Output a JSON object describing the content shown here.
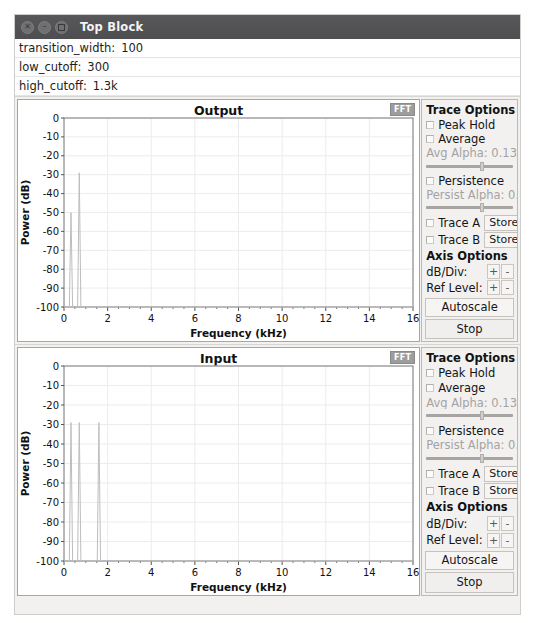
{
  "window": {
    "title": "Top Block",
    "controls": [
      {
        "name": "close",
        "glyph": "×"
      },
      {
        "name": "minimize",
        "glyph": "–"
      },
      {
        "name": "maximize",
        "glyph": ""
      }
    ]
  },
  "params": [
    {
      "label": "transition_width:",
      "value": "100"
    },
    {
      "label": "low_cutoff:",
      "value": "300"
    },
    {
      "label": "high_cutoff:",
      "value": "1.3k"
    }
  ],
  "options": {
    "trace_header": "Trace Options",
    "peak_hold": "Peak Hold",
    "average": "Average",
    "avg_alpha": "Avg Alpha: 0.1333",
    "persistence": "Persistence",
    "persist_alpha": "Persist Alpha: 0.18",
    "trace_a": "Trace A",
    "trace_b": "Trace B",
    "store": "Store",
    "axis_header": "Axis Options",
    "db_div": "dB/Div:",
    "ref_level": "Ref Level:",
    "plus": "+",
    "minus": "-",
    "autoscale": "Autoscale",
    "stop": "Stop",
    "fft_tab": "FFT"
  },
  "chart_data": [
    {
      "type": "line",
      "title": "Output",
      "xlabel": "Frequency (kHz)",
      "ylabel": "Power (dB)",
      "xlim": [
        0,
        16
      ],
      "ylim": [
        -100,
        0
      ],
      "xticks": [
        0,
        2,
        4,
        6,
        8,
        10,
        12,
        14,
        16
      ],
      "yticks": [
        0,
        -10,
        -20,
        -30,
        -40,
        -50,
        -60,
        -70,
        -80,
        -90,
        -100
      ],
      "grid": true,
      "legend": "none",
      "peaks": [
        {
          "freq_khz": 0.32,
          "peak_db": -50
        },
        {
          "freq_khz": 0.7,
          "peak_db": -29
        }
      ],
      "noise_floor_db": -100
    },
    {
      "type": "line",
      "title": "Input",
      "xlabel": "Frequency (kHz)",
      "ylabel": "Power (dB)",
      "xlim": [
        0,
        16
      ],
      "ylim": [
        -100,
        0
      ],
      "xticks": [
        0,
        2,
        4,
        6,
        8,
        10,
        12,
        14,
        16
      ],
      "yticks": [
        0,
        -10,
        -20,
        -30,
        -40,
        -50,
        -60,
        -70,
        -80,
        -90,
        -100
      ],
      "grid": true,
      "legend": "none",
      "peaks": [
        {
          "freq_khz": 0.32,
          "peak_db": -29
        },
        {
          "freq_khz": 0.7,
          "peak_db": -29
        },
        {
          "freq_khz": 1.6,
          "peak_db": -29
        }
      ],
      "noise_floor_db": -100
    }
  ],
  "colors": {
    "titlebar": "#4e4d50",
    "trace": "#b9b9b9",
    "panel": "#f2f1f0",
    "plot_bg": "#ffffff",
    "grid": "#e9e9e9"
  }
}
